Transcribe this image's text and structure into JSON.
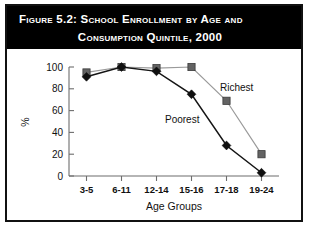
{
  "figure": {
    "title_line_1": "Figure 5.2:  School Enrollment by Age and",
    "title_line_2": "Consumption Quintile, 2000",
    "title_bar_color": "#000000",
    "title_text_color": "#ffffff",
    "frame_color": "#111111",
    "background_color": "#ffffff"
  },
  "chart_data": {
    "type": "line",
    "title": "Figure 5.2: School Enrollment by Age and Consumption Quintile, 2000",
    "xlabel": "Age Groups",
    "ylabel": "%",
    "categories": [
      "3-5",
      "6-11",
      "12-14",
      "15-16",
      "17-18",
      "19-24"
    ],
    "series": [
      {
        "name": "Poorest",
        "values": [
          91,
          100,
          96,
          75,
          28,
          3
        ],
        "color": "#101010",
        "marker": "diamond"
      },
      {
        "name": "Richest",
        "values": [
          95,
          100,
          99,
          100,
          69,
          20
        ],
        "color": "#636363",
        "marker": "square"
      }
    ],
    "ylim": [
      0,
      100
    ],
    "yticks": [
      0,
      20,
      40,
      60,
      80,
      100
    ],
    "ytick_labels": [
      "0",
      "20",
      "40",
      "60",
      "80",
      "100"
    ],
    "grid": false,
    "legend": "inline-annotations",
    "annotations": [
      {
        "text": "Poorest",
        "series": "Poorest"
      },
      {
        "text": "Richest",
        "series": "Richest"
      }
    ]
  }
}
